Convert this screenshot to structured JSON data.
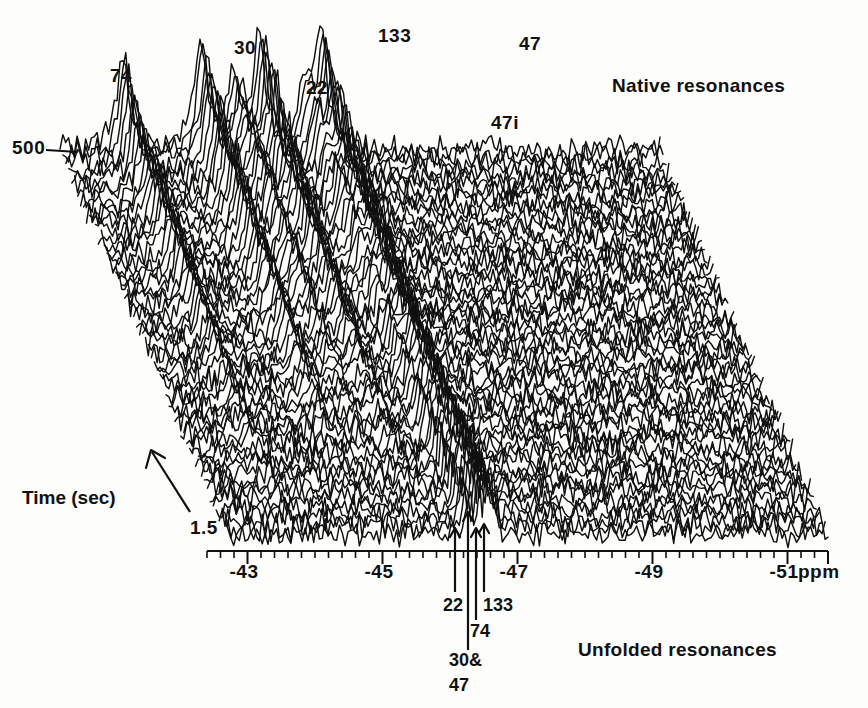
{
  "figure": {
    "type": "nmr-stacked-waterfall-plot",
    "background": "#fdfdfb",
    "ink": "#101010"
  },
  "annotations": {
    "native_resonances": "Native resonances",
    "unfolded_resonances": "Unfolded resonances",
    "time_axis_label": "Time (sec)",
    "time_min": "1.5",
    "time_max": "500",
    "ppm_unit": "ppm"
  },
  "native_peak_labels": [
    {
      "text": "74",
      "x": 110,
      "y": 66,
      "ppm": -43.35
    },
    {
      "text": "30",
      "x": 234,
      "y": 38,
      "ppm": -44.55
    },
    {
      "text": "22",
      "x": 306,
      "y": 78,
      "ppm": -45.05
    },
    {
      "text": "133",
      "x": 378,
      "y": 26,
      "ppm": -45.45
    },
    {
      "text": "47",
      "x": 519,
      "y": 34,
      "ppm": -46.4
    },
    {
      "text": "47i",
      "x": 491,
      "y": 113,
      "ppm": -46.15
    }
  ],
  "unfolded_arrow_labels": [
    {
      "text": "22",
      "x": 443,
      "y": 596
    },
    {
      "text": "133",
      "x": 483,
      "y": 596
    },
    {
      "text": "74",
      "x": 470,
      "y": 622
    },
    {
      "text": "30&",
      "x": 449,
      "y": 651
    },
    {
      "text": "47",
      "x": 449,
      "y": 676
    }
  ],
  "chart_data": {
    "type": "line",
    "title": "",
    "subtitle": "",
    "xlabel": "ppm",
    "ylabel": "Time (sec)",
    "zlabel": "Intensity",
    "grid": false,
    "legend": "none",
    "projection": "stacked-waterfall-3d",
    "x_axis": {
      "unit": "ppm",
      "direction": "decreasing-left-to-right",
      "range": [
        -42.4,
        -51.6
      ],
      "tick_labels": [
        "-43",
        "-45",
        "-47",
        "-49",
        "-51"
      ],
      "tick_values": [
        -43,
        -45,
        -47,
        -49,
        -51
      ],
      "major_tick_step": 1,
      "minor_tick_step": 0.2,
      "pixel_left": 207,
      "pixel_right": 828,
      "ppm_at_left": -42.4,
      "ppm_at_right": -51.6
    },
    "y_axis": {
      "unit": "sec",
      "label": "Time (sec)",
      "front_value": 1.5,
      "back_value": 500,
      "direction": "increasing-back",
      "n_traces": 58
    },
    "native_resonances": {
      "comment": "Resonances of folded/native protein; decay as protein unfolds. ppm positions of ridge apex at the back (t=500 s).",
      "series": [
        {
          "name": "74",
          "ppm": -43.35,
          "peak_height": 0.78,
          "decays": true
        },
        {
          "name": "30",
          "ppm": -44.55,
          "peak_height": 0.92,
          "decays": true
        },
        {
          "name": "22",
          "ppm": -45.05,
          "peak_height": 0.6,
          "decays": true
        },
        {
          "name": "133",
          "ppm": -45.45,
          "peak_height": 1.0,
          "decays": true
        },
        {
          "name": "47i",
          "ppm": -46.15,
          "peak_height": 0.5,
          "decays": true
        },
        {
          "name": "47",
          "ppm": -46.4,
          "peak_height": 0.95,
          "decays": true
        }
      ]
    },
    "unfolded_resonances": {
      "comment": "Narrow resonances of unfolded protein; grow in with time near -46.2 to -46.6 ppm, marked by arrows below the axis.",
      "series": [
        {
          "name": "22",
          "ppm": -46.1,
          "arrow_x": 455,
          "grows": true
        },
        {
          "name": "30&47",
          "ppm": -46.28,
          "arrow_x": 468,
          "grows": true
        },
        {
          "name": "74",
          "ppm": -46.4,
          "arrow_x": 476,
          "grows": true
        },
        {
          "name": "133",
          "ppm": -46.5,
          "arrow_x": 484,
          "grows": true
        }
      ]
    },
    "noise_level": 0.085
  }
}
